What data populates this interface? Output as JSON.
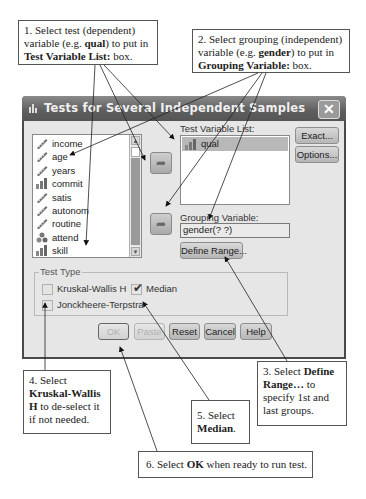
{
  "callouts": {
    "c1": {
      "line1": "1. Select test (dependent)",
      "line2_pre": "variable (e.g. ",
      "line2_bold": "qual",
      "line2_post": ") to put in",
      "line3_bold": "Test Variable List:",
      "line3_post": " box."
    },
    "c2": {
      "line1": "2. Select grouping (independent)",
      "line2_pre": "variable (e.g. ",
      "line2_bold": "gender",
      "line2_post": ") to put in",
      "line3_bold": "Grouping Variable:",
      "line3_post": " box."
    },
    "c3": {
      "line1_pre": "3. Select ",
      "line1_bold": "Define",
      "line2_bold": "Range…",
      "line2_post": " to",
      "line3": "specify 1st and",
      "line4": "last groups."
    },
    "c4": {
      "line1": "4. Select",
      "line2_bold": "Kruskal-Wallis",
      "line3_bold": "H",
      "line3_post": " to de-select it",
      "line4": "if not needed."
    },
    "c5": {
      "line1": "5. Select",
      "line2_bold": "Median",
      "line2_post": "."
    },
    "c6": {
      "pre": "6. Select ",
      "bold": "OK",
      "post": " when ready to run test."
    }
  },
  "dialog": {
    "title": "Tests for Several Independent Samples",
    "close_label": "✕",
    "source_variables": [
      {
        "name": "income",
        "icon": "ruler-icon"
      },
      {
        "name": "age",
        "icon": "ruler-icon"
      },
      {
        "name": "years",
        "icon": "ruler-icon"
      },
      {
        "name": "commit",
        "icon": "bar-chart-icon"
      },
      {
        "name": "satis",
        "icon": "ruler-icon"
      },
      {
        "name": "autonom",
        "icon": "ruler-icon"
      },
      {
        "name": "routine",
        "icon": "ruler-icon"
      },
      {
        "name": "attend",
        "icon": "nominal-icon"
      },
      {
        "name": "skill",
        "icon": "bar-chart-icon"
      }
    ],
    "test_variable_label": "Test Variable List:",
    "test_variables": [
      {
        "name": "qual",
        "icon": "bar-chart-icon",
        "selected": true
      }
    ],
    "grouping_variable_label": "Grouping Variable:",
    "grouping_variable_value": "gender(? ?)",
    "define_range_label": "Define Range...",
    "exact_label": "Exact...",
    "options_label": "Options...",
    "test_type": {
      "legend": "Test Type",
      "kruskal_wallis": {
        "label": "Kruskal-Wallis H",
        "checked": false
      },
      "median": {
        "label": "Median",
        "checked": true
      },
      "jonckheere": {
        "label": "Jonckheere-Terpstra",
        "checked": false
      }
    },
    "buttons": {
      "ok": "OK",
      "paste": "Paste",
      "reset": "Reset",
      "cancel": "Cancel",
      "help": "Help"
    }
  }
}
